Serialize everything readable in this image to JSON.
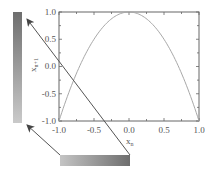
{
  "chart_data": {
    "type": "line",
    "title": "",
    "xlabel": "x_n",
    "ylabel": "x_{n+1}",
    "xlabel_main": "x",
    "xlabel_sub": "n",
    "ylabel_main": "x",
    "ylabel_sub": "n+1",
    "xlim": [
      -1.0,
      1.0
    ],
    "ylim": [
      -1.0,
      1.0
    ],
    "x_ticks": [
      "-1.0",
      "-0.5",
      "0.0",
      "0.5",
      "1.0"
    ],
    "y_ticks": [
      "1.0",
      "0.5",
      "0.0",
      "-0.5",
      "-1.0"
    ],
    "grid": false,
    "legend": null,
    "series": [
      {
        "name": "x_{n+1} = 1 - 2 x_n^2",
        "color": "#a8a8a8",
        "x": [
          -1.0,
          -0.9,
          -0.8,
          -0.7,
          -0.6,
          -0.5,
          -0.4,
          -0.3,
          -0.2,
          -0.1,
          0.0,
          0.1,
          0.2,
          0.3,
          0.4,
          0.5,
          0.6,
          0.7,
          0.8,
          0.9,
          1.0
        ],
        "y": [
          -1.0,
          -0.62,
          -0.28,
          0.02,
          0.28,
          0.5,
          0.68,
          0.82,
          0.92,
          0.98,
          1.0,
          0.98,
          0.92,
          0.82,
          0.68,
          0.5,
          0.28,
          0.02,
          -0.28,
          -0.62,
          -1.0
        ]
      }
    ]
  },
  "diagram": {
    "horizontal_bar": {
      "color_light": "#c4c4c4",
      "color_dark": "#6e6e6e",
      "meaning": "input x_n gradient"
    },
    "vertical_bar": {
      "color_light": "#cacaca",
      "color_dark": "#6e6e6e",
      "meaning": "output x_{n+1} gradient"
    },
    "arrow_color": "#555555",
    "arrows": [
      {
        "from": "horizontal-bar-left",
        "to": "vertical-bar-bottom"
      },
      {
        "from": "horizontal-bar-right",
        "to": "vertical-bar-top"
      }
    ]
  }
}
